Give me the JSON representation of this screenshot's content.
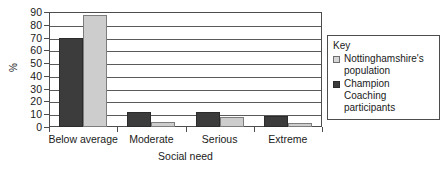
{
  "chart_data": {
    "type": "bar",
    "title": "",
    "xlabel": "Social need",
    "ylabel": "%",
    "ylim": [
      0,
      90
    ],
    "ytick_step": 10,
    "grid": true,
    "legend_position": "right",
    "legend_title": "Key",
    "categories": [
      "Below average",
      "Moderate",
      "Serious",
      "Extreme"
    ],
    "series": [
      {
        "name": "Champion Coaching participants",
        "color": "#3c3c3c",
        "values": [
          70,
          12,
          11.5,
          8.5
        ]
      },
      {
        "name": "Nottinghamshire's population",
        "color": "#cdcdcd",
        "values": [
          88,
          4,
          8,
          3.5
        ]
      }
    ],
    "yticks": [
      "90",
      "80",
      "70",
      "60",
      "50",
      "40",
      "30",
      "20",
      "10",
      "0"
    ]
  },
  "legend": {
    "title": "Key",
    "entries": [
      {
        "label_line1": "Nottinghamshire's",
        "label_line2": "population",
        "swatch": "light-swatch-icon"
      },
      {
        "label_line1": "Champion Coaching",
        "label_line2": "participants",
        "swatch": "dark-swatch-icon"
      }
    ]
  },
  "axes": {
    "y_title": "%",
    "x_title": "Social need"
  }
}
